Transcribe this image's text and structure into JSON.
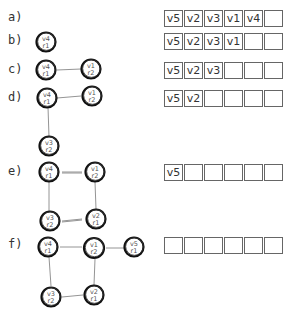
{
  "steps": [
    {
      "label": "a)",
      "array": [
        "v5",
        "v2",
        "v3",
        "v1",
        "v4",
        ""
      ]
    },
    {
      "label": "b)",
      "array": [
        "v5",
        "v2",
        "v3",
        "v1",
        "",
        ""
      ]
    },
    {
      "label": "c)",
      "array": [
        "v5",
        "v2",
        "v3",
        "",
        "",
        ""
      ]
    },
    {
      "label": "d)",
      "array": [
        "v5",
        "v2",
        "",
        "",
        "",
        ""
      ]
    },
    {
      "label": "e)",
      "array": [
        "v5",
        "",
        "",
        "",
        "",
        ""
      ]
    },
    {
      "label": "f)",
      "array": [
        "",
        "",
        "",
        "",
        "",
        ""
      ]
    }
  ],
  "nodes": {
    "b_v4": {
      "v": "v4",
      "r": "r1"
    },
    "c_v4": {
      "v": "v4",
      "r": "r1"
    },
    "c_v1": {
      "v": "v1",
      "r": "r2"
    },
    "d_v4": {
      "v": "v4",
      "r": "r1"
    },
    "d_v1": {
      "v": "v1",
      "r": "r2"
    },
    "d_v3": {
      "v": "v3",
      "r": "r2"
    },
    "e_v4": {
      "v": "v4",
      "r": "r1"
    },
    "e_v1": {
      "v": "v1",
      "r": "r2"
    },
    "e_v3": {
      "v": "v3",
      "r": "r2"
    },
    "e_v2": {
      "v": "v2",
      "r": "r1"
    },
    "f_v4": {
      "v": "v4",
      "r": "r1"
    },
    "f_v1": {
      "v": "v1",
      "r": "r2"
    },
    "f_v5": {
      "v": "v5",
      "r": "r1"
    },
    "f_v3": {
      "v": "v3",
      "r": "r2"
    },
    "f_v2": {
      "v": "v2",
      "r": "r1"
    }
  }
}
